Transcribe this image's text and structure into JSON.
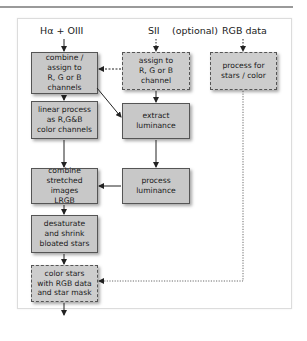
{
  "diagram": {
    "inputs": {
      "ha_oiii": "Hα + OIII",
      "sii": "SII",
      "optional": "(optional)",
      "rgb": "RGB data"
    },
    "boxes": {
      "combine_assign": [
        "combine /",
        "assign to",
        "R, G or B channels"
      ],
      "assign_sii": [
        "assign to",
        "R, G or B channel"
      ],
      "process_stars": [
        "process for",
        "stars / color"
      ],
      "linear_process": [
        "linear process",
        "as R,G&B",
        "color channels"
      ],
      "extract_lum": [
        "extract",
        "luminance"
      ],
      "combine_lrgb": [
        "combine",
        "stretched images",
        "LRGB"
      ],
      "process_lum": [
        "process",
        "luminance"
      ],
      "desaturate": [
        "desaturate",
        "and shrink",
        "bloated stars"
      ],
      "color_stars": [
        "color stars",
        "with RGB data",
        "and star mask"
      ]
    },
    "colors": {
      "box_fill": "#c8c8c8",
      "box_border": "#555555",
      "arrow": "#222222"
    }
  }
}
